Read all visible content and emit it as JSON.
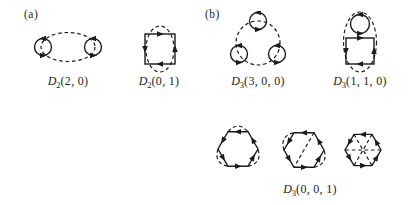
{
  "figure": {
    "background_color": "#ffffff",
    "ink_color": "#1c1c1c",
    "panel_a": {
      "label": "(a)",
      "diagrams": [
        {
          "symbol": "D",
          "sub": "2",
          "args": "(2, 0)"
        },
        {
          "symbol": "D",
          "sub": "2",
          "args": "(0, 1)"
        }
      ]
    },
    "panel_b": {
      "label": "(b)",
      "diagrams": [
        {
          "symbol": "D",
          "sub": "3",
          "args": "(3, 0, 0)"
        },
        {
          "symbol": "D",
          "sub": "3",
          "args": "(1, 1, 0)"
        },
        {
          "symbol": "D",
          "sub": "3",
          "args": "(0, 0, 1)"
        }
      ]
    }
  }
}
